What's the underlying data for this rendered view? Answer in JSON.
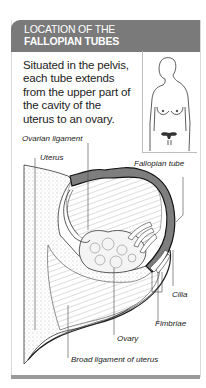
{
  "header": {
    "title_line1": "LOCATION OF THE",
    "title_line2": "FALLOPIAN TUBES"
  },
  "intro": {
    "text": "Situated in the pelvis, each tube extends from the upper part of the cavity of the uterus to an ovary."
  },
  "thumbnail": {
    "icon": "female-torso-with-uterus-icon"
  },
  "labels": {
    "ovarian_ligament": "Ovarian ligament",
    "uterus": "Uterus",
    "fallopian_tube": "Fallopian tube",
    "cilia": "Cilia",
    "fimbriae": "Fimbriae",
    "ovary": "Ovary",
    "broad_ligament": "Broad ligament of uterus"
  },
  "colors": {
    "header_bg": "#7a7a7a",
    "tube_fill": "#8a8a8a",
    "outline": "#222222"
  }
}
